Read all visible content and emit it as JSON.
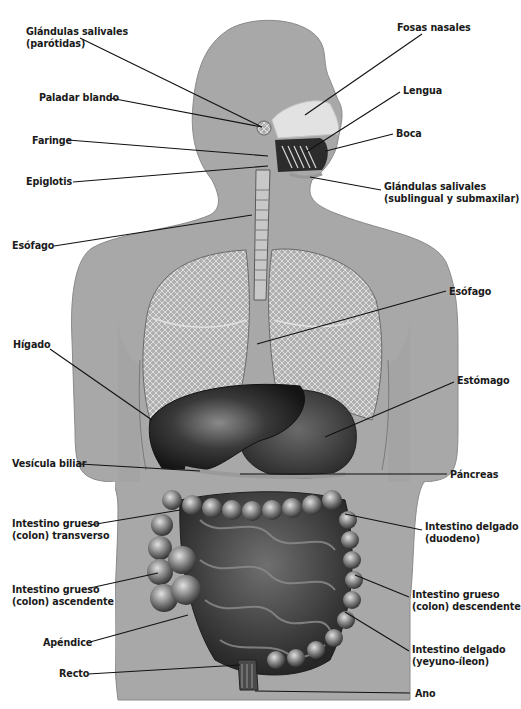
{
  "diagram": {
    "colors": {
      "background": "#ffffff",
      "body_silhouette": "#a9a9a9",
      "body_edge": "#8a8a8a",
      "lung": "#b4b4b4",
      "lung_mesh": "#e6e6e6",
      "liver": "#2e2e2e",
      "stomach": "#4a4a4a",
      "intestine": "#3c3c3c",
      "colon": "#7a7a7a",
      "nasal": "#e4e4e4",
      "leader_line": "#111111",
      "label_text": "#1a1a1a"
    }
  },
  "labels": {
    "left": [
      {
        "id": "parotidas",
        "lines": [
          "Glándulas salivales",
          "(parótidas)"
        ],
        "x": 26,
        "y": 26,
        "x1": 80,
        "y1": 38,
        "x2": 262,
        "y2": 127
      },
      {
        "id": "paladar",
        "lines": [
          "Paladar blando"
        ],
        "x": 39,
        "y": 92,
        "x1": 110,
        "y1": 98,
        "x2": 262,
        "y2": 127
      },
      {
        "id": "faringe",
        "lines": [
          "Faringe"
        ],
        "x": 32,
        "y": 135,
        "x1": 68,
        "y1": 140,
        "x2": 268,
        "y2": 156
      },
      {
        "id": "epiglotis",
        "lines": [
          "Epiglotis"
        ],
        "x": 26,
        "y": 176,
        "x1": 73,
        "y1": 182,
        "x2": 268,
        "y2": 166
      },
      {
        "id": "esofago-top",
        "lines": [
          "Esófago"
        ],
        "x": 12,
        "y": 240,
        "x1": 54,
        "y1": 246,
        "x2": 252,
        "y2": 215
      },
      {
        "id": "higado",
        "lines": [
          "Hígado"
        ],
        "x": 13,
        "y": 339,
        "x1": 50,
        "y1": 349,
        "x2": 152,
        "y2": 420
      },
      {
        "id": "vesicula",
        "lines": [
          "Vesícula biliar"
        ],
        "x": 12,
        "y": 458,
        "x1": 80,
        "y1": 464,
        "x2": 200,
        "y2": 471
      },
      {
        "id": "colon-transverso",
        "lines": [
          "Intestino grueso",
          "(colon) transverso"
        ],
        "x": 12,
        "y": 518,
        "x1": 90,
        "y1": 525,
        "x2": 180,
        "y2": 510
      },
      {
        "id": "colon-ascendente",
        "lines": [
          "Intestino grueso",
          "(colon) ascendente"
        ],
        "x": 12,
        "y": 584,
        "x1": 90,
        "y1": 588,
        "x2": 158,
        "y2": 573
      },
      {
        "id": "apendice",
        "lines": [
          "Apéndice"
        ],
        "x": 43,
        "y": 637,
        "x1": 90,
        "y1": 642,
        "x2": 188,
        "y2": 615
      },
      {
        "id": "recto",
        "lines": [
          "Recto"
        ],
        "x": 59,
        "y": 668,
        "x1": 88,
        "y1": 674,
        "x2": 240,
        "y2": 665
      }
    ],
    "right": [
      {
        "id": "fosas-nasales",
        "lines": [
          "Fosas nasales"
        ],
        "x": 397,
        "y": 22,
        "x1": 422,
        "y1": 34,
        "x2": 305,
        "y2": 115
      },
      {
        "id": "lengua",
        "lines": [
          "Lengua"
        ],
        "x": 403,
        "y": 85,
        "x1": 400,
        "y1": 92,
        "x2": 306,
        "y2": 152
      },
      {
        "id": "boca",
        "lines": [
          "Boca"
        ],
        "x": 396,
        "y": 128,
        "x1": 393,
        "y1": 134,
        "x2": 326,
        "y2": 151
      },
      {
        "id": "salivales-sub",
        "lines": [
          "Glándulas salivales",
          "(sublingual y submaxilar)"
        ],
        "x": 384,
        "y": 181,
        "x1": 381,
        "y1": 190,
        "x2": 310,
        "y2": 177
      },
      {
        "id": "esofago-right",
        "lines": [
          "Esófago"
        ],
        "x": 449,
        "y": 286,
        "x1": 446,
        "y1": 291,
        "x2": 257,
        "y2": 344
      },
      {
        "id": "estomago",
        "lines": [
          "Estómago"
        ],
        "x": 457,
        "y": 375,
        "x1": 454,
        "y1": 382,
        "x2": 325,
        "y2": 437
      },
      {
        "id": "pancreas",
        "lines": [
          "Páncreas"
        ],
        "x": 450,
        "y": 469,
        "x1": 447,
        "y1": 474,
        "x2": 240,
        "y2": 474
      },
      {
        "id": "delgado-duodeno",
        "lines": [
          "Intestino delgado",
          "(duodeno)"
        ],
        "x": 425,
        "y": 521,
        "x1": 422,
        "y1": 530,
        "x2": 345,
        "y2": 514
      },
      {
        "id": "colon-descendente",
        "lines": [
          "Intestino grueso",
          "(colon) descendente"
        ],
        "x": 412,
        "y": 589,
        "x1": 409,
        "y1": 597,
        "x2": 355,
        "y2": 575
      },
      {
        "id": "delgado-yeyuno",
        "lines": [
          "Intestino delgado",
          "(yeyuno-íleon)"
        ],
        "x": 412,
        "y": 644,
        "x1": 409,
        "y1": 651,
        "x2": 345,
        "y2": 612
      },
      {
        "id": "ano",
        "lines": [
          "Ano"
        ],
        "x": 415,
        "y": 688,
        "x1": 410,
        "y1": 693,
        "x2": 255,
        "y2": 691
      }
    ]
  }
}
